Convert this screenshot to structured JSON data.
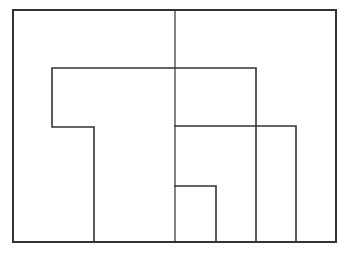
{
  "diagram": {
    "type": "rectilinear-partition",
    "background": "#ffffff",
    "stroke_color": "#333333",
    "outer_frame": {
      "x1": 13,
      "y1": 10,
      "x2": 336,
      "y2": 242,
      "stroke_width": 2
    },
    "segments": [
      {
        "id": "center-vertical",
        "points": [
          [
            175,
            10
          ],
          [
            175,
            242
          ]
        ],
        "stroke_width": 1.2
      },
      {
        "id": "upper-l-shape",
        "points": [
          [
            256,
            242
          ],
          [
            256,
            68
          ],
          [
            52,
            68
          ],
          [
            52,
            127
          ],
          [
            94,
            127
          ],
          [
            94,
            242
          ]
        ],
        "stroke_width": 1.6
      },
      {
        "id": "middle-bracket",
        "points": [
          [
            175,
            126
          ],
          [
            296,
            126
          ],
          [
            296,
            242
          ]
        ],
        "stroke_width": 1.6
      },
      {
        "id": "small-bracket",
        "points": [
          [
            175,
            186
          ],
          [
            216,
            186
          ],
          [
            216,
            242
          ]
        ],
        "stroke_width": 1.6
      }
    ]
  }
}
